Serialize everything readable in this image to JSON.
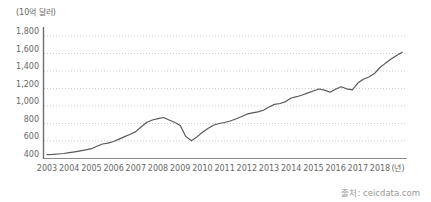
{
  "chart_data": {
    "type": "line",
    "unit_label": "(10억 달러)",
    "x_unit_label": "(년)",
    "y_ticks": [
      "400",
      "600",
      "800",
      "1,000",
      "1,200",
      "1,400",
      "1,600",
      "1,800"
    ],
    "y_tick_values": [
      400,
      600,
      800,
      1000,
      1200,
      1400,
      1600,
      1800
    ],
    "x_ticks": [
      "2003",
      "2004",
      "2005",
      "2006",
      "2007",
      "2008",
      "2009",
      "2010",
      "2011",
      "2012",
      "2013",
      "2014",
      "2015",
      "2016",
      "2017",
      "2018"
    ],
    "x_tick_values": [
      2003,
      2004,
      2005,
      2006,
      2007,
      2008,
      2009,
      2010,
      2011,
      2012,
      2013,
      2014,
      2015,
      2016,
      2017,
      2018
    ],
    "ylim": [
      400,
      1800
    ],
    "xlim": [
      2003,
      2019.1
    ],
    "grid": "horizontal-dotted",
    "legend": "none",
    "line_color": "#58595a",
    "grid_color": "#cccccc",
    "axis_color": "#8c8c8c",
    "x": [
      2003.0,
      2003.25,
      2003.5,
      2003.75,
      2004.0,
      2004.25,
      2004.5,
      2004.75,
      2005.0,
      2005.25,
      2005.5,
      2005.75,
      2006.0,
      2006.25,
      2006.5,
      2006.75,
      2007.0,
      2007.25,
      2007.5,
      2007.75,
      2008.0,
      2008.25,
      2008.5,
      2008.75,
      2009.0,
      2009.25,
      2009.5,
      2009.75,
      2010.0,
      2010.25,
      2010.5,
      2010.75,
      2011.0,
      2011.25,
      2011.5,
      2011.75,
      2012.0,
      2012.25,
      2012.5,
      2012.75,
      2013.0,
      2013.25,
      2013.5,
      2013.75,
      2014.0,
      2014.25,
      2014.5,
      2014.75,
      2015.0,
      2015.25,
      2015.5,
      2015.75,
      2016.0,
      2016.25,
      2016.5,
      2016.75,
      2017.0,
      2017.25,
      2017.5,
      2017.75,
      2018.0,
      2018.25,
      2018.5,
      2018.75,
      2019.0
    ],
    "values": [
      445,
      447,
      451,
      457,
      466,
      476,
      487,
      498,
      512,
      540,
      566,
      576,
      594,
      622,
      650,
      678,
      708,
      762,
      815,
      840,
      856,
      868,
      840,
      815,
      778,
      652,
      602,
      645,
      700,
      742,
      780,
      800,
      812,
      828,
      852,
      878,
      906,
      921,
      933,
      952,
      988,
      1018,
      1028,
      1050,
      1092,
      1106,
      1126,
      1150,
      1172,
      1194,
      1182,
      1156,
      1192,
      1220,
      1196,
      1184,
      1262,
      1306,
      1332,
      1370,
      1440,
      1490,
      1536,
      1576,
      1615
    ]
  },
  "source": "출처: ceicdata.com"
}
